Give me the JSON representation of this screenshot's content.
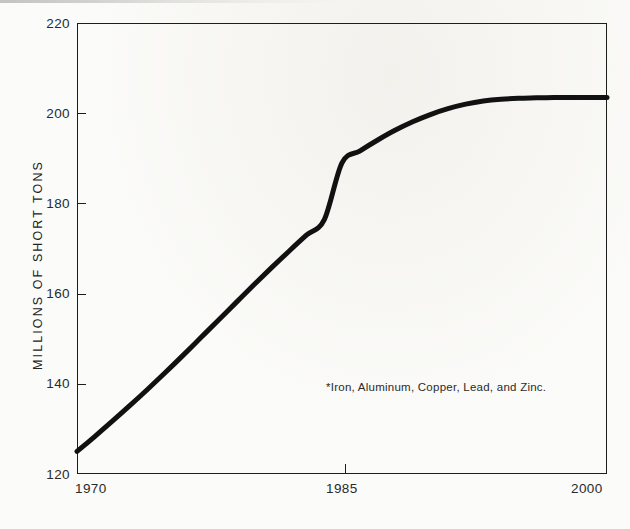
{
  "figure": {
    "background_color": "#fbfbf9",
    "ink_color": "#1d1d1d"
  },
  "chart_data": {
    "type": "line",
    "title": "",
    "subtitle": "",
    "xlabel": "",
    "ylabel": "MILLIONS OF SHORT TONS",
    "xlim": [
      1970,
      2000
    ],
    "ylim": [
      120,
      220
    ],
    "xticks": [
      1970,
      1985,
      2000
    ],
    "xtick_labels": [
      "1970",
      "1985",
      "2000"
    ],
    "yticks": [
      120,
      140,
      160,
      180,
      200,
      220
    ],
    "ytick_labels": [
      "120",
      "140",
      "160",
      "180",
      "200",
      "220"
    ],
    "grid": false,
    "legend": "none",
    "annotations": [
      {
        "name": "footnote",
        "text": "*Iron, Aluminum, Copper, Lead, and Zinc.",
        "x": 1988.5,
        "y": 140.5
      }
    ],
    "series": [
      {
        "name": "Consumption of major metals",
        "color": "#111111",
        "linewidth": 5,
        "x": [
          1970,
          1971,
          1972,
          1973,
          1974,
          1975,
          1976,
          1977,
          1978,
          1979,
          1980,
          1981,
          1982,
          1983,
          1984,
          1985,
          1986,
          1987,
          1988,
          1989,
          1990,
          1991,
          1992,
          1993,
          1994,
          1995,
          1996,
          1997,
          1998,
          1999,
          2000
        ],
        "y": [
          125.0,
          128.3,
          131.7,
          135.2,
          138.8,
          142.5,
          146.3,
          150.2,
          154.1,
          158.0,
          161.9,
          165.7,
          169.4,
          173.0,
          176.4,
          189.0,
          191.6,
          194.0,
          196.2,
          198.1,
          199.7,
          201.0,
          202.0,
          202.7,
          203.1,
          203.3,
          203.4,
          203.5,
          203.5,
          203.5,
          203.5
        ]
      }
    ],
    "curve_reference_points": [
      {
        "year": 1970,
        "value": 125.0
      },
      {
        "year": 1975,
        "value": 142.5
      },
      {
        "year": 1980,
        "value": 162.0
      },
      {
        "year": 1985,
        "value": 189.0
      },
      {
        "year": 1990,
        "value": 199.7
      },
      {
        "year": 1995,
        "value": 203.3
      },
      {
        "year": 2000,
        "value": 203.5
      }
    ]
  },
  "axes": {
    "y_title": "MILLIONS OF SHORT TONS",
    "y_ticks": [
      {
        "label": "220",
        "value": 220
      },
      {
        "label": "200",
        "value": 200
      },
      {
        "label": "180",
        "value": 180
      },
      {
        "label": "160",
        "value": 160
      },
      {
        "label": "140",
        "value": 140
      },
      {
        "label": "120",
        "value": 120
      }
    ],
    "x_ticks": [
      {
        "label": "1970",
        "value": 1970
      },
      {
        "label": "1985",
        "value": 1985
      },
      {
        "label": "2000",
        "value": 2000
      }
    ]
  },
  "footnote": {
    "text": "*Iron, Aluminum, Copper, Lead, and Zinc."
  }
}
